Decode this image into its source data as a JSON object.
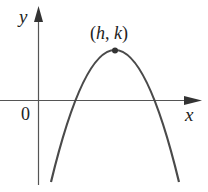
{
  "diagram": {
    "type": "parabola-graph",
    "axes": {
      "x_label": "x",
      "y_label": "y",
      "origin_label": "0"
    },
    "vertex": {
      "label": "(h, k)",
      "label_parts": [
        "(",
        "h",
        ", ",
        "k",
        ")"
      ]
    },
    "curve": {
      "description": "Downward-opening parabola with vertex at (h, k), crossing the x-axis at two positive x-values",
      "opens": "down"
    },
    "colors": {
      "stroke": "#4a4a4a",
      "axis": "#555555",
      "text": "#222222",
      "background": "#ffffff"
    }
  }
}
